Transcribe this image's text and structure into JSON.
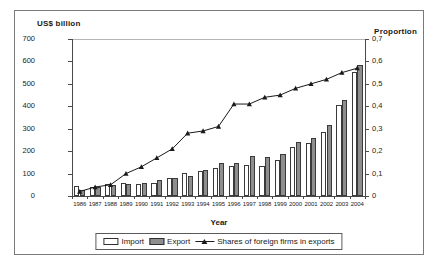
{
  "figure": {
    "left_axis_title": "US$ billion",
    "right_axis_title": "Proportion",
    "x_axis_title": "Year"
  },
  "legend": {
    "items": [
      {
        "label": "Import",
        "type": "bar-white"
      },
      {
        "label": "Export",
        "type": "bar-gray"
      },
      {
        "label": "Shares of foreign firms in exports",
        "type": "line-marker"
      }
    ]
  },
  "chart_data": {
    "type": "bar",
    "title": "",
    "subtitle": "",
    "xlabel": "Year",
    "ylabel": "US$ billion",
    "y2label": "Proportion",
    "grid": false,
    "legend_position": "bottom",
    "categories": [
      "1986",
      "1987",
      "1988",
      "1989",
      "1990",
      "1991",
      "1992",
      "1993",
      "1994",
      "1995",
      "1996",
      "1997",
      "1998",
      "1999",
      "2000",
      "2001",
      "2002",
      "2003",
      "2004"
    ],
    "ylim": [
      0,
      700
    ],
    "yticks": [
      0,
      100,
      200,
      300,
      400,
      500,
      600,
      700
    ],
    "ytick_labels": [
      "0",
      "100",
      "200",
      "300",
      "400",
      "500",
      "600",
      "700"
    ],
    "y2lim": [
      0,
      0.7
    ],
    "y2ticks": [
      0,
      0.1,
      0.2,
      0.3,
      0.4,
      0.5,
      0.6,
      0.7
    ],
    "y2tick_labels": [
      "0",
      "0,1",
      "0,2",
      "0,3",
      "0,4",
      "0,5",
      "0,6",
      "0,7"
    ],
    "series": [
      {
        "name": "Import",
        "kind": "bar",
        "axis": "left",
        "color": "#ffffff",
        "values": [
          43,
          40,
          53,
          59,
          52,
          60,
          79,
          101,
          113,
          126,
          134,
          137,
          133,
          159,
          217,
          235,
          286,
          405,
          553
        ]
      },
      {
        "name": "Export",
        "kind": "bar",
        "axis": "left",
        "color": "#8e8e8e",
        "values": [
          28,
          38,
          50,
          54,
          60,
          70,
          82,
          89,
          117,
          145,
          148,
          177,
          176,
          189,
          241,
          258,
          317,
          429,
          584
        ]
      },
      {
        "name": "Shares of foreign firms in exports",
        "kind": "line",
        "axis": "right",
        "color": "#1a1a1a",
        "marker": "triangle",
        "values": [
          0.02,
          0.04,
          0.05,
          0.1,
          0.13,
          0.17,
          0.21,
          0.28,
          0.29,
          0.31,
          0.41,
          0.41,
          0.44,
          0.45,
          0.48,
          0.5,
          0.52,
          0.55,
          0.57
        ]
      }
    ]
  }
}
